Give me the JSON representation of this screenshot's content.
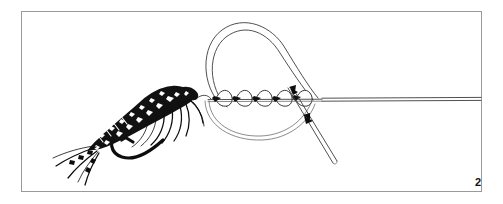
{
  "figure": {
    "step_number": "2",
    "caption": "",
    "frame_color": "#9a9a9a",
    "background_color": "#ffffff",
    "ink_color": "#111111",
    "line_color": "#3c3c3c"
  },
  "elements": {
    "fly": {
      "name": "artificial-fly",
      "label": ""
    },
    "hook": {
      "name": "hook",
      "label": ""
    },
    "loop": {
      "name": "leader-loop",
      "label": ""
    },
    "wraps": {
      "name": "helical-wraps",
      "label": "",
      "turn_count": 5
    },
    "standing_line": {
      "name": "standing-line",
      "label": ""
    },
    "tag_end": {
      "name": "tag-end",
      "label": ""
    },
    "arrows": {
      "name": "direction-arrows",
      "count": 2,
      "label": ""
    }
  }
}
